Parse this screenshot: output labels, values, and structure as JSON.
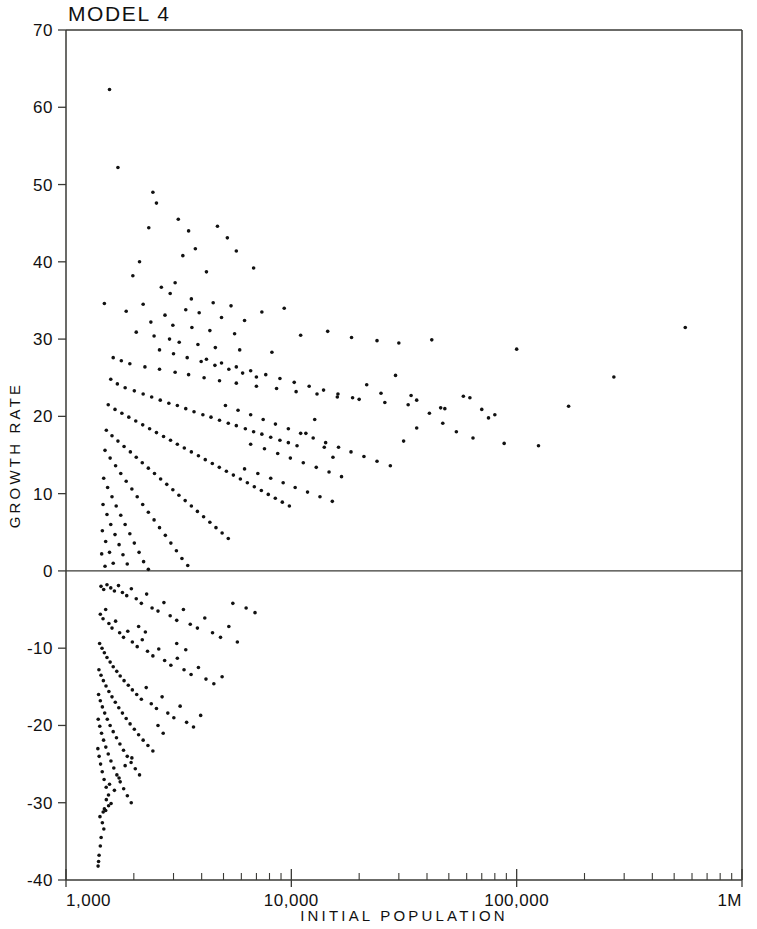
{
  "chart_data": {
    "type": "scatter",
    "title": "MODEL 4",
    "xlabel": "INITIAL POPULATION",
    "ylabel": "GROWTH RATE",
    "xscale": "log",
    "yscale": "linear",
    "xlim": [
      1000,
      1000000
    ],
    "ylim": [
      -40,
      70
    ],
    "grid": false,
    "legend": null,
    "x_tick_labels": [
      "1,000",
      "10,000",
      "100,000",
      "1M"
    ],
    "x_tick_values": [
      1000,
      10000,
      100000,
      1000000
    ],
    "y_tick_labels": [
      "70",
      "60",
      "50",
      "40",
      "30",
      "20",
      "10",
      "0",
      "-10",
      "-20",
      "-30",
      "-40"
    ],
    "y_tick_values": [
      70,
      60,
      50,
      40,
      30,
      20,
      10,
      0,
      -10,
      -20,
      -30,
      -40
    ],
    "zero_reference_line": 0,
    "marker": "dot",
    "marker_color": "#111111",
    "marker_size": 3,
    "n_points": 392,
    "points": [
      [
        1560,
        62.3
      ],
      [
        1700,
        52.2
      ],
      [
        1480,
        34.6
      ],
      [
        2430,
        49.0
      ],
      [
        2520,
        47.6
      ],
      [
        2330,
        44.4
      ],
      [
        3150,
        45.5
      ],
      [
        3500,
        44.0
      ],
      [
        4700,
        44.6
      ],
      [
        5200,
        43.1
      ],
      [
        5700,
        41.4
      ],
      [
        3750,
        41.7
      ],
      [
        3300,
        40.8
      ],
      [
        2120,
        40.0
      ],
      [
        1980,
        38.2
      ],
      [
        6800,
        39.2
      ],
      [
        4200,
        38.7
      ],
      [
        3050,
        37.3
      ],
      [
        2650,
        36.7
      ],
      [
        2900,
        35.9
      ],
      [
        3600,
        35.2
      ],
      [
        4500,
        34.7
      ],
      [
        5400,
        34.3
      ],
      [
        9300,
        34.0
      ],
      [
        2200,
        34.5
      ],
      [
        1850,
        33.6
      ],
      [
        2750,
        33.1
      ],
      [
        3400,
        33.8
      ],
      [
        3900,
        33.4
      ],
      [
        4900,
        32.8
      ],
      [
        6200,
        32.4
      ],
      [
        7400,
        33.5
      ],
      [
        2380,
        32.2
      ],
      [
        2980,
        31.8
      ],
      [
        3620,
        31.5
      ],
      [
        4350,
        31.1
      ],
      [
        5600,
        30.7
      ],
      [
        11000,
        30.5
      ],
      [
        14500,
        31.0
      ],
      [
        18500,
        30.2
      ],
      [
        2050,
        30.9
      ],
      [
        2460,
        30.4
      ],
      [
        2880,
        30.0
      ],
      [
        3180,
        29.6
      ],
      [
        3850,
        29.3
      ],
      [
        4600,
        28.9
      ],
      [
        5900,
        28.6
      ],
      [
        8200,
        28.3
      ],
      [
        24000,
        29.8
      ],
      [
        30000,
        29.5
      ],
      [
        42000,
        29.9
      ],
      [
        100000,
        28.7
      ],
      [
        560000,
        31.5
      ],
      [
        270000,
        25.1
      ],
      [
        170000,
        21.3
      ],
      [
        1620,
        27.6
      ],
      [
        1760,
        27.2
      ],
      [
        1920,
        26.8
      ],
      [
        2240,
        26.4
      ],
      [
        2600,
        26.1
      ],
      [
        3050,
        25.7
      ],
      [
        3500,
        25.4
      ],
      [
        4100,
        25.0
      ],
      [
        4800,
        24.6
      ],
      [
        5700,
        24.3
      ],
      [
        7000,
        23.9
      ],
      [
        8600,
        23.6
      ],
      [
        10500,
        23.2
      ],
      [
        13000,
        22.9
      ],
      [
        16000,
        22.5
      ],
      [
        20000,
        22.2
      ],
      [
        26000,
        21.8
      ],
      [
        33000,
        21.5
      ],
      [
        46000,
        21.1
      ],
      [
        62000,
        22.4
      ],
      [
        80000,
        20.2
      ],
      [
        1580,
        24.8
      ],
      [
        1690,
        24.2
      ],
      [
        1830,
        23.7
      ],
      [
        2010,
        23.3
      ],
      [
        2200,
        22.9
      ],
      [
        2400,
        22.5
      ],
      [
        2620,
        22.1
      ],
      [
        2860,
        21.7
      ],
      [
        3120,
        21.4
      ],
      [
        3400,
        21.0
      ],
      [
        3700,
        20.6
      ],
      [
        4050,
        20.2
      ],
      [
        4400,
        19.9
      ],
      [
        4800,
        19.5
      ],
      [
        5250,
        19.1
      ],
      [
        5700,
        18.8
      ],
      [
        6250,
        18.4
      ],
      [
        6800,
        18.0
      ],
      [
        7400,
        17.7
      ],
      [
        8100,
        17.3
      ],
      [
        8900,
        16.9
      ],
      [
        9700,
        16.6
      ],
      [
        10600,
        16.2
      ],
      [
        11600,
        17.8
      ],
      [
        12700,
        19.6
      ],
      [
        14000,
        16.0
      ],
      [
        15300,
        14.7
      ],
      [
        1540,
        21.5
      ],
      [
        1650,
        20.9
      ],
      [
        1770,
        20.4
      ],
      [
        1900,
        19.9
      ],
      [
        2040,
        19.4
      ],
      [
        2190,
        18.9
      ],
      [
        2350,
        18.4
      ],
      [
        2520,
        17.9
      ],
      [
        2710,
        17.4
      ],
      [
        2910,
        16.9
      ],
      [
        3120,
        16.4
      ],
      [
        3350,
        15.9
      ],
      [
        3600,
        15.4
      ],
      [
        3870,
        14.9
      ],
      [
        4150,
        14.4
      ],
      [
        4460,
        13.9
      ],
      [
        4790,
        13.4
      ],
      [
        5150,
        12.9
      ],
      [
        5530,
        12.4
      ],
      [
        5940,
        11.9
      ],
      [
        6380,
        11.4
      ],
      [
        6850,
        10.9
      ],
      [
        7360,
        10.4
      ],
      [
        7900,
        9.9
      ],
      [
        8490,
        9.4
      ],
      [
        9120,
        8.9
      ],
      [
        9800,
        8.4
      ],
      [
        1510,
        18.2
      ],
      [
        1600,
        17.5
      ],
      [
        1700,
        16.8
      ],
      [
        1810,
        16.1
      ],
      [
        1930,
        15.4
      ],
      [
        2050,
        14.7
      ],
      [
        2180,
        14.0
      ],
      [
        2320,
        13.3
      ],
      [
        2470,
        12.6
      ],
      [
        2630,
        11.9
      ],
      [
        2800,
        11.2
      ],
      [
        2980,
        10.5
      ],
      [
        3170,
        9.8
      ],
      [
        3380,
        9.1
      ],
      [
        3600,
        8.4
      ],
      [
        3830,
        7.7
      ],
      [
        4080,
        7.0
      ],
      [
        4350,
        6.3
      ],
      [
        4630,
        5.6
      ],
      [
        4930,
        4.9
      ],
      [
        5250,
        4.2
      ],
      [
        1490,
        15.6
      ],
      [
        1570,
        14.6
      ],
      [
        1660,
        13.6
      ],
      [
        1750,
        12.6
      ],
      [
        1850,
        11.6
      ],
      [
        1960,
        10.6
      ],
      [
        2070,
        9.6
      ],
      [
        2190,
        8.6
      ],
      [
        2320,
        7.6
      ],
      [
        2460,
        6.6
      ],
      [
        2600,
        5.6
      ],
      [
        2760,
        4.6
      ],
      [
        2920,
        3.6
      ],
      [
        3090,
        2.6
      ],
      [
        3270,
        1.6
      ],
      [
        3470,
        0.7
      ],
      [
        1470,
        12.0
      ],
      [
        1530,
        10.8
      ],
      [
        1600,
        9.6
      ],
      [
        1670,
        8.4
      ],
      [
        1750,
        7.2
      ],
      [
        1830,
        6.0
      ],
      [
        1920,
        4.8
      ],
      [
        2010,
        3.6
      ],
      [
        2110,
        2.4
      ],
      [
        2210,
        1.2
      ],
      [
        2320,
        0.2
      ],
      [
        1460,
        8.6
      ],
      [
        1520,
        7.3
      ],
      [
        1580,
        6.0
      ],
      [
        1650,
        4.7
      ],
      [
        1720,
        3.4
      ],
      [
        1790,
        2.1
      ],
      [
        1870,
        0.9
      ],
      [
        1450,
        5.2
      ],
      [
        1500,
        3.8
      ],
      [
        1560,
        2.4
      ],
      [
        1620,
        1.0
      ],
      [
        1440,
        2.2
      ],
      [
        1490,
        0.6
      ],
      [
        6200,
        13.2
      ],
      [
        7100,
        12.6
      ],
      [
        8100,
        12.0
      ],
      [
        9200,
        11.4
      ],
      [
        10400,
        10.8
      ],
      [
        11800,
        10.2
      ],
      [
        13400,
        9.6
      ],
      [
        15200,
        9.0
      ],
      [
        6600,
        16.4
      ],
      [
        7600,
        15.8
      ],
      [
        8700,
        15.2
      ],
      [
        9900,
        14.6
      ],
      [
        11300,
        14.0
      ],
      [
        12900,
        13.4
      ],
      [
        14700,
        12.8
      ],
      [
        16700,
        12.2
      ],
      [
        5100,
        21.4
      ],
      [
        5800,
        20.8
      ],
      [
        6600,
        20.2
      ],
      [
        7500,
        19.6
      ],
      [
        8500,
        19.0
      ],
      [
        9700,
        18.4
      ],
      [
        11000,
        17.8
      ],
      [
        12500,
        17.2
      ],
      [
        14200,
        16.6
      ],
      [
        16200,
        16.0
      ],
      [
        18400,
        15.4
      ],
      [
        21000,
        14.8
      ],
      [
        24000,
        14.2
      ],
      [
        27500,
        13.6
      ],
      [
        31500,
        16.8
      ],
      [
        36000,
        18.5
      ],
      [
        41000,
        20.4
      ],
      [
        47000,
        19.1
      ],
      [
        54000,
        18.0
      ],
      [
        64000,
        17.2
      ],
      [
        75000,
        19.8
      ],
      [
        88000,
        16.5
      ],
      [
        125000,
        16.2
      ],
      [
        36000,
        22.1
      ],
      [
        48000,
        21.0
      ],
      [
        58000,
        22.6
      ],
      [
        70000,
        20.9
      ],
      [
        4200,
        27.4
      ],
      [
        4900,
        26.9
      ],
      [
        5700,
        26.4
      ],
      [
        6600,
        25.9
      ],
      [
        7700,
        25.4
      ],
      [
        8900,
        24.9
      ],
      [
        10300,
        24.4
      ],
      [
        12000,
        23.9
      ],
      [
        13900,
        23.4
      ],
      [
        16100,
        22.9
      ],
      [
        18700,
        22.4
      ],
      [
        21600,
        24.1
      ],
      [
        25000,
        23.0
      ],
      [
        29000,
        25.3
      ],
      [
        34000,
        22.7
      ],
      [
        2600,
        28.6
      ],
      [
        3000,
        28.1
      ],
      [
        3450,
        27.6
      ],
      [
        3980,
        27.1
      ],
      [
        4580,
        26.6
      ],
      [
        5280,
        26.1
      ],
      [
        6080,
        25.6
      ],
      [
        7000,
        25.1
      ],
      [
        1430,
        -2.0
      ],
      [
        1470,
        -2.4
      ],
      [
        1520,
        -1.8
      ],
      [
        1580,
        -2.2
      ],
      [
        1640,
        -2.6
      ],
      [
        1710,
        -1.9
      ],
      [
        1780,
        -2.8
      ],
      [
        1860,
        -3.2
      ],
      [
        1950,
        -2.3
      ],
      [
        2050,
        -3.6
      ],
      [
        2160,
        -4.2
      ],
      [
        2280,
        -3.0
      ],
      [
        2410,
        -4.8
      ],
      [
        2560,
        -5.2
      ],
      [
        2720,
        -4.1
      ],
      [
        2900,
        -5.8
      ],
      [
        3100,
        -6.4
      ],
      [
        3320,
        -5.0
      ],
      [
        3560,
        -6.9
      ],
      [
        3830,
        -7.4
      ],
      [
        4130,
        -6.1
      ],
      [
        4470,
        -8.0
      ],
      [
        4850,
        -8.6
      ],
      [
        5280,
        -7.2
      ],
      [
        5760,
        -9.2
      ],
      [
        6300,
        -4.8
      ],
      [
        6900,
        -5.4
      ],
      [
        5500,
        -4.2
      ],
      [
        1420,
        -5.6
      ],
      [
        1460,
        -6.2
      ],
      [
        1500,
        -5.0
      ],
      [
        1550,
        -6.8
      ],
      [
        1600,
        -7.4
      ],
      [
        1660,
        -6.5
      ],
      [
        1730,
        -8.0
      ],
      [
        1800,
        -8.6
      ],
      [
        1880,
        -7.8
      ],
      [
        1970,
        -9.2
      ],
      [
        2070,
        -9.8
      ],
      [
        2180,
        -8.9
      ],
      [
        2300,
        -10.4
      ],
      [
        2430,
        -11.0
      ],
      [
        2580,
        -10.1
      ],
      [
        2740,
        -11.6
      ],
      [
        2920,
        -12.2
      ],
      [
        3120,
        -11.3
      ],
      [
        3340,
        -12.8
      ],
      [
        3590,
        -13.4
      ],
      [
        3870,
        -12.5
      ],
      [
        4180,
        -14.0
      ],
      [
        4530,
        -14.6
      ],
      [
        4930,
        -13.7
      ],
      [
        3100,
        -9.4
      ],
      [
        3400,
        -10.2
      ],
      [
        2100,
        -7.2
      ],
      [
        2250,
        -7.9
      ],
      [
        1410,
        -9.4
      ],
      [
        1445,
        -10.0
      ],
      [
        1480,
        -10.6
      ],
      [
        1520,
        -11.2
      ],
      [
        1570,
        -11.8
      ],
      [
        1620,
        -12.4
      ],
      [
        1680,
        -13.0
      ],
      [
        1740,
        -13.6
      ],
      [
        1810,
        -14.2
      ],
      [
        1890,
        -14.8
      ],
      [
        1970,
        -15.4
      ],
      [
        2060,
        -16.0
      ],
      [
        2160,
        -16.6
      ],
      [
        2270,
        -15.1
      ],
      [
        2390,
        -17.2
      ],
      [
        2520,
        -17.8
      ],
      [
        2670,
        -16.3
      ],
      [
        2830,
        -18.4
      ],
      [
        3010,
        -19.0
      ],
      [
        3210,
        -17.5
      ],
      [
        3430,
        -19.6
      ],
      [
        3680,
        -20.2
      ],
      [
        3960,
        -18.7
      ],
      [
        1400,
        -12.8
      ],
      [
        1430,
        -13.5
      ],
      [
        1465,
        -14.2
      ],
      [
        1505,
        -14.9
      ],
      [
        1550,
        -15.6
      ],
      [
        1600,
        -16.3
      ],
      [
        1655,
        -17.0
      ],
      [
        1715,
        -17.7
      ],
      [
        1780,
        -18.4
      ],
      [
        1850,
        -19.1
      ],
      [
        1925,
        -19.8
      ],
      [
        2010,
        -20.5
      ],
      [
        2100,
        -21.2
      ],
      [
        2200,
        -21.9
      ],
      [
        2310,
        -22.6
      ],
      [
        2430,
        -23.3
      ],
      [
        2560,
        -20.0
      ],
      [
        2700,
        -21.0
      ],
      [
        1395,
        -16.0
      ],
      [
        1420,
        -16.8
      ],
      [
        1450,
        -17.6
      ],
      [
        1485,
        -18.4
      ],
      [
        1525,
        -19.2
      ],
      [
        1570,
        -20.0
      ],
      [
        1620,
        -20.8
      ],
      [
        1675,
        -21.6
      ],
      [
        1735,
        -22.4
      ],
      [
        1800,
        -23.2
      ],
      [
        1870,
        -24.0
      ],
      [
        1945,
        -24.8
      ],
      [
        2030,
        -25.6
      ],
      [
        2120,
        -26.4
      ],
      [
        1390,
        -19.2
      ],
      [
        1412,
        -20.1
      ],
      [
        1438,
        -21.0
      ],
      [
        1468,
        -21.9
      ],
      [
        1502,
        -22.8
      ],
      [
        1540,
        -23.7
      ],
      [
        1583,
        -24.6
      ],
      [
        1630,
        -25.5
      ],
      [
        1682,
        -26.4
      ],
      [
        1740,
        -27.3
      ],
      [
        1803,
        -28.2
      ],
      [
        1872,
        -29.1
      ],
      [
        1948,
        -30.0
      ],
      [
        1385,
        -23.0
      ],
      [
        1403,
        -24.0
      ],
      [
        1424,
        -25.0
      ],
      [
        1448,
        -26.0
      ],
      [
        1476,
        -27.0
      ],
      [
        1508,
        -28.0
      ],
      [
        1544,
        -29.0
      ],
      [
        1585,
        -30.1
      ],
      [
        1545,
        -30.4
      ],
      [
        1510,
        -29.6
      ],
      [
        1480,
        -30.8
      ],
      [
        1462,
        -31.2
      ],
      [
        1500,
        -31.0
      ],
      [
        1450,
        -32.6
      ],
      [
        1472,
        -33.4
      ],
      [
        1432,
        -34.5
      ],
      [
        1420,
        -35.6
      ],
      [
        1402,
        -36.8
      ],
      [
        1395,
        -37.6
      ],
      [
        1388,
        -38.2
      ],
      [
        1415,
        -31.8
      ],
      [
        1560,
        -27.6
      ],
      [
        1640,
        -28.4
      ],
      [
        1720,
        -26.8
      ],
      [
        1830,
        -25.2
      ],
      [
        1960,
        -24.2
      ]
    ]
  }
}
